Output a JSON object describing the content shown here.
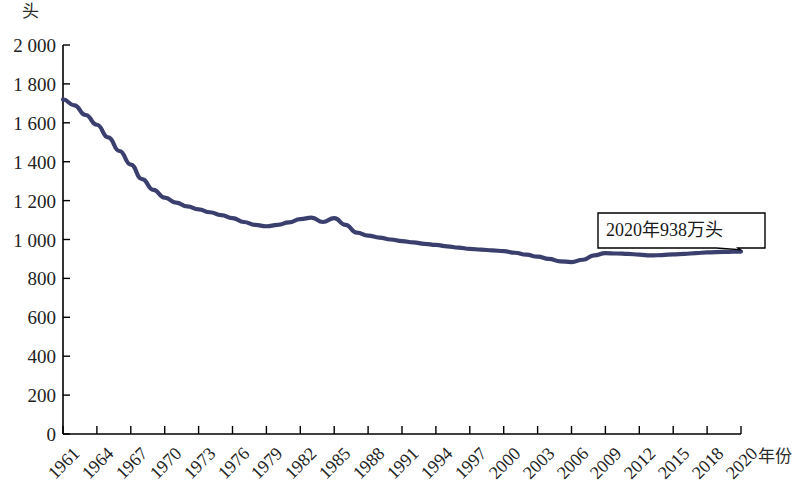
{
  "chart_data": {
    "type": "line",
    "title": "",
    "subtitle": "",
    "unit_label": "头",
    "xlabel": "年份",
    "ylabel": "",
    "ylim": [
      0,
      2000
    ],
    "xlim": [
      1961,
      2020
    ],
    "grid": false,
    "legend": null,
    "legend_position": "none",
    "line_color": "#3a3f6e",
    "axis_color": "#000000",
    "ytick_labels": [
      "2 000",
      "1 800",
      "1 600",
      "1 400",
      "1 200",
      "1 000",
      "800",
      "600",
      "400",
      "200",
      "0"
    ],
    "ytick_values": [
      2000,
      1800,
      1600,
      1400,
      1200,
      1000,
      800,
      600,
      400,
      200,
      0
    ],
    "xtick_labels": [
      "1961",
      "1964",
      "1967",
      "1970",
      "1973",
      "1976",
      "1979",
      "1982",
      "1985",
      "1988",
      "1991",
      "1994",
      "1997",
      "2000",
      "2003",
      "2006",
      "2009",
      "2012",
      "2015",
      "2018",
      "2020"
    ],
    "xtick_values": [
      1961,
      1964,
      1967,
      1970,
      1973,
      1976,
      1979,
      1982,
      1985,
      1988,
      1991,
      1994,
      1997,
      2000,
      2003,
      2006,
      2009,
      2012,
      2015,
      2018,
      2020
    ],
    "annotations": [
      {
        "text": "2020年938万头",
        "target_x": 2020,
        "target_y": 938
      }
    ],
    "series": [
      {
        "name": "存栏量",
        "x": [
          1961,
          1962,
          1963,
          1964,
          1965,
          1966,
          1967,
          1968,
          1969,
          1970,
          1971,
          1972,
          1973,
          1974,
          1975,
          1976,
          1977,
          1978,
          1979,
          1980,
          1981,
          1982,
          1983,
          1984,
          1985,
          1986,
          1987,
          1988,
          1989,
          1990,
          1991,
          1992,
          1993,
          1994,
          1995,
          1996,
          1997,
          1998,
          1999,
          2000,
          2001,
          2002,
          2003,
          2004,
          2005,
          2006,
          2007,
          2008,
          2009,
          2010,
          2011,
          2012,
          2013,
          2014,
          2015,
          2016,
          2017,
          2018,
          2019,
          2020
        ],
        "values": [
          1720,
          1690,
          1640,
          1590,
          1525,
          1455,
          1385,
          1310,
          1255,
          1215,
          1190,
          1170,
          1155,
          1140,
          1125,
          1110,
          1090,
          1075,
          1068,
          1075,
          1088,
          1105,
          1112,
          1090,
          1110,
          1075,
          1035,
          1020,
          1010,
          1000,
          992,
          985,
          978,
          972,
          965,
          958,
          952,
          948,
          944,
          940,
          932,
          922,
          912,
          900,
          888,
          884,
          896,
          918,
          930,
          928,
          926,
          922,
          918,
          920,
          924,
          926,
          930,
          934,
          936,
          938
        ]
      }
    ]
  },
  "callout": {
    "text": "2020年938万头"
  }
}
